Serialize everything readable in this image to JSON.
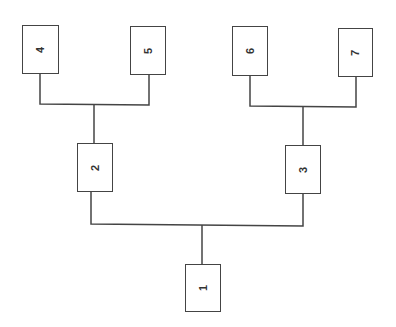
{
  "diagram": {
    "type": "tree",
    "orientation": "bottom-up",
    "line_color": "#444444",
    "nodes": [
      {
        "id": "1",
        "label": "1",
        "x": 185,
        "y": 264,
        "w": 36,
        "h": 48
      },
      {
        "id": "2",
        "label": "2",
        "x": 77,
        "y": 143,
        "w": 36,
        "h": 49
      },
      {
        "id": "3",
        "label": "3",
        "x": 285,
        "y": 145,
        "w": 36,
        "h": 49
      },
      {
        "id": "4",
        "label": "4",
        "x": 22,
        "y": 25,
        "w": 37,
        "h": 49
      },
      {
        "id": "5",
        "label": "5",
        "x": 130,
        "y": 26,
        "w": 36,
        "h": 49
      },
      {
        "id": "6",
        "label": "6",
        "x": 232,
        "y": 26,
        "w": 36,
        "h": 50
      },
      {
        "id": "7",
        "label": "7",
        "x": 338,
        "y": 28,
        "w": 35,
        "h": 49
      }
    ],
    "edges": [
      {
        "from": "1",
        "to": "2"
      },
      {
        "from": "1",
        "to": "3"
      },
      {
        "from": "2",
        "to": "4"
      },
      {
        "from": "2",
        "to": "5"
      },
      {
        "from": "3",
        "to": "6"
      },
      {
        "from": "3",
        "to": "7"
      }
    ]
  }
}
